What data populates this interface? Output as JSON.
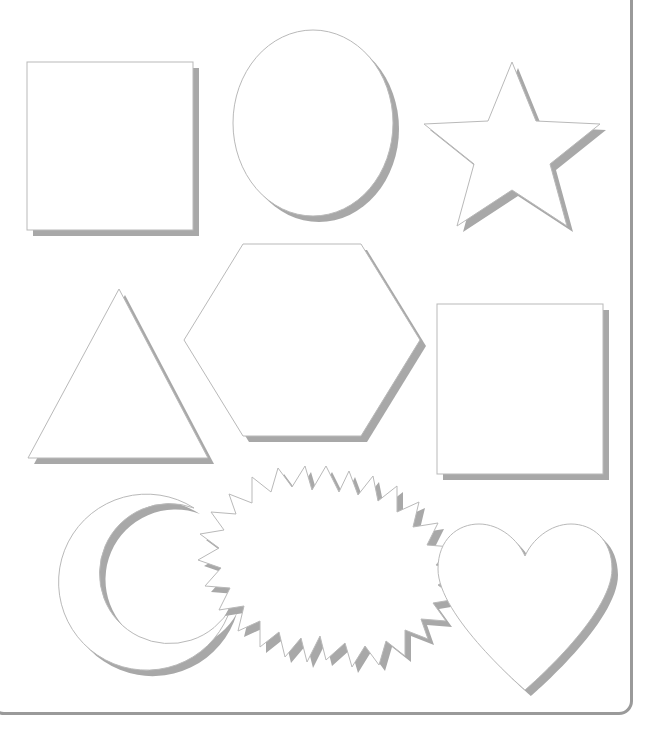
{
  "page": {
    "background_color": "#ffffff",
    "frame": {
      "visible": true,
      "color": "#9a9a9a",
      "corner_radius": 14,
      "stroke_width": 3
    }
  },
  "style": {
    "shape_fill": "#ffffff",
    "shape_outline_color": "#b9b9b9",
    "shape_outline_width": 1,
    "shadow_color": "#a8a8a8",
    "shadow_offset_x": 6,
    "shadow_offset_y": 6
  },
  "shapes": [
    {
      "id": "square-1",
      "name": "square",
      "label": "Square",
      "row": 1,
      "column": 1,
      "x": 27,
      "y": 62,
      "width": 166,
      "height": 168
    },
    {
      "id": "circle-1",
      "name": "circle",
      "label": "Circle",
      "row": 1,
      "column": 2,
      "cx": 313,
      "cy": 123,
      "rx": 80,
      "ry": 93
    },
    {
      "id": "star-1",
      "name": "star",
      "label": "Five-pointed Star",
      "row": 1,
      "column": 3,
      "cx": 512,
      "cy": 160,
      "outer_radius": 98,
      "inner_radius": 41,
      "points": 5,
      "rotation": -90
    },
    {
      "id": "triangle-1",
      "name": "triangle",
      "label": "Triangle",
      "row": 2,
      "column": 1,
      "apex_x": 119,
      "top_y": 289,
      "left_x": 28,
      "right_x": 208,
      "bottom_y": 458
    },
    {
      "id": "hexagon-1",
      "name": "hexagon",
      "label": "Hexagon",
      "row": 2,
      "column": 2,
      "cx": 302,
      "cy": 340,
      "rx": 118,
      "ry": 96
    },
    {
      "id": "square-2",
      "name": "square",
      "label": "Square",
      "row": 2,
      "column": 3,
      "x": 437,
      "y": 304,
      "width": 166,
      "height": 170
    },
    {
      "id": "crescent-1",
      "name": "crescent-moon",
      "label": "Crescent Moon",
      "row": 3,
      "column": 1,
      "cx": 138,
      "cy": 589,
      "radius": 88
    },
    {
      "id": "sunburst-1",
      "name": "sunburst",
      "label": "Sunburst",
      "row": 3,
      "column": 2,
      "cx": 326,
      "cy": 562,
      "outer_radius": 96,
      "inner_radius": 71,
      "points": 24
    },
    {
      "id": "heart-1",
      "name": "heart",
      "label": "Heart",
      "row": 3,
      "column": 3,
      "cx": 525,
      "cy": 600,
      "width": 167,
      "height": 160
    }
  ]
}
